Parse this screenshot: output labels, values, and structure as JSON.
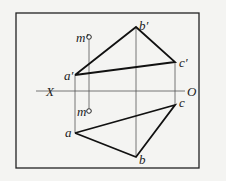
{
  "diagram": {
    "type": "orthographic-projection",
    "axis": {
      "left_label": "X",
      "right_label": "O"
    },
    "points": {
      "a_prime": {
        "label": "a′",
        "x": 75,
        "y": 75
      },
      "b_prime": {
        "label": "b′",
        "x": 136,
        "y": 27
      },
      "c_prime": {
        "label": "c′",
        "x": 175,
        "y": 62
      },
      "m_prime": {
        "label": "m′",
        "x": 89,
        "y": 37
      },
      "a": {
        "label": "a",
        "x": 75,
        "y": 133
      },
      "b": {
        "label": "b",
        "x": 136,
        "y": 157
      },
      "c": {
        "label": "c",
        "x": 175,
        "y": 105
      },
      "m": {
        "label": "m",
        "x": 89,
        "y": 111
      }
    },
    "colors": {
      "line": "#111111",
      "thin": "#555555",
      "bg": "#f4f4f2"
    }
  }
}
